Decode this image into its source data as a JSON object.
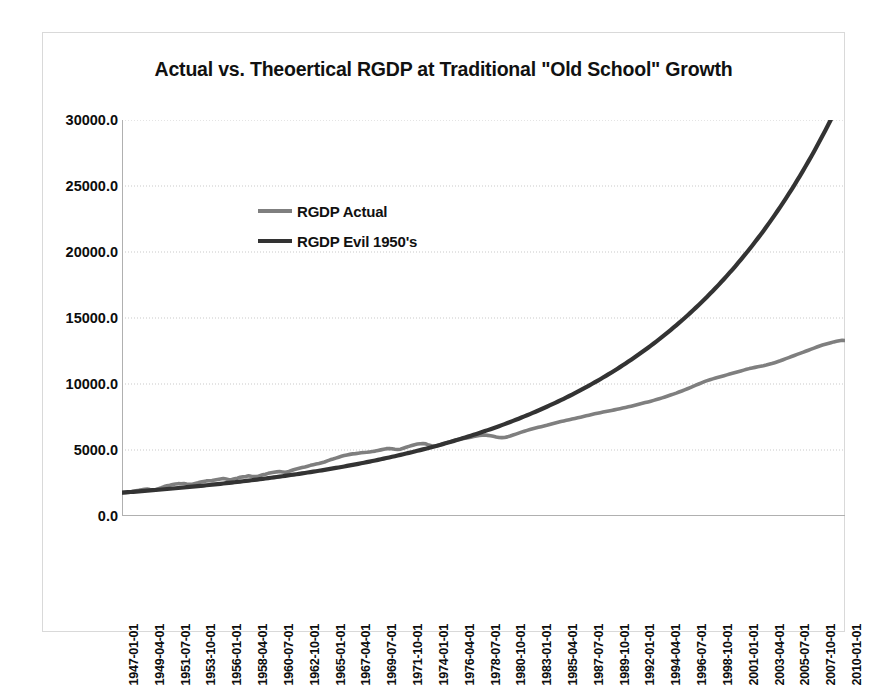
{
  "chart_data": {
    "type": "line",
    "title": "Actual vs. Theoertical  RGDP at Traditional \"Old School\" Growth",
    "xlabel": "",
    "ylabel": "",
    "ylim": [
      0,
      30000
    ],
    "yticks": [
      0,
      5000,
      10000,
      15000,
      20000,
      25000,
      30000
    ],
    "ytick_labels": [
      "0.0",
      "5000.0",
      "10000.0",
      "15000.0",
      "20000.0",
      "25000.0",
      "30000.0"
    ],
    "grid": true,
    "legend_position": "inside-upper-left",
    "x_tick_labels": [
      "1947-01-01",
      "1949-04-01",
      "1951-07-01",
      "1953-10-01",
      "1956-01-01",
      "1958-04-01",
      "1960-07-01",
      "1962-10-01",
      "1965-01-01",
      "1967-04-01",
      "1969-07-01",
      "1971-10-01",
      "1974-01-01",
      "1976-04-01",
      "1978-07-01",
      "1980-10-01",
      "1983-01-01",
      "1985-04-01",
      "1987-07-01",
      "1989-10-01",
      "1992-01-01",
      "1994-04-01",
      "1996-07-01",
      "1998-10-01",
      "2001-01-01",
      "2003-04-01",
      "2005-07-01",
      "2007-10-01",
      "2010-01-01"
    ],
    "x_start": "1947-01-01",
    "x_end": "2011-04-01",
    "x_frequency": "quarterly",
    "n_points": 258,
    "series": [
      {
        "name": "RGDP Actual",
        "color": "#7f7f7f",
        "values": [
          1770,
          1768,
          1780,
          1797,
          1871,
          1910,
          1944,
          1987,
          2021,
          2033,
          2008,
          1991,
          2006,
          2074,
          2145,
          2231,
          2292,
          2328,
          2382,
          2418,
          2450,
          2441,
          2458,
          2425,
          2404,
          2400,
          2463,
          2513,
          2576,
          2620,
          2659,
          2674,
          2689,
          2730,
          2770,
          2807,
          2840,
          2797,
          2744,
          2759,
          2815,
          2869,
          2936,
          2965,
          2997,
          3041,
          3016,
          2997,
          2985,
          3052,
          3120,
          3167,
          3231,
          3272,
          3311,
          3342,
          3369,
          3339,
          3310,
          3342,
          3428,
          3504,
          3563,
          3614,
          3668,
          3718,
          3775,
          3836,
          3889,
          3934,
          3982,
          4039,
          4093,
          4178,
          4256,
          4317,
          4385,
          4456,
          4520,
          4578,
          4624,
          4668,
          4705,
          4724,
          4756,
          4790,
          4813,
          4830,
          4854,
          4882,
          4916,
          4964,
          5010,
          5058,
          5102,
          5120,
          5100,
          5060,
          5035,
          5064,
          5138,
          5207,
          5274,
          5342,
          5405,
          5449,
          5478,
          5490,
          5465,
          5375,
          5317,
          5280,
          5322,
          5388,
          5450,
          5518,
          5580,
          5650,
          5710,
          5770,
          5820,
          5862,
          5894,
          5930,
          5972,
          6018,
          6062,
          6098,
          6120,
          6130,
          6110,
          6080,
          6035,
          5985,
          5948,
          5935,
          5950,
          5995,
          6060,
          6130,
          6205,
          6280,
          6352,
          6420,
          6487,
          6550,
          6610,
          6665,
          6718,
          6770,
          6820,
          6872,
          6930,
          6990,
          7050,
          7105,
          7158,
          7205,
          7250,
          7295,
          7340,
          7390,
          7440,
          7490,
          7540,
          7590,
          7640,
          7690,
          7738,
          7785,
          7830,
          7875,
          7920,
          7962,
          8000,
          8040,
          8085,
          8130,
          8175,
          8220,
          8268,
          8318,
          8370,
          8425,
          8480,
          8535,
          8590,
          8645,
          8700,
          8760,
          8820,
          8885,
          8950,
          9020,
          9090,
          9162,
          9235,
          9310,
          9390,
          9470,
          9555,
          9640,
          9730,
          9820,
          9910,
          10000,
          10090,
          10175,
          10255,
          10325,
          10390,
          10450,
          10510,
          10570,
          10630,
          10690,
          10750,
          10810,
          10870,
          10930,
          10990,
          11050,
          11110,
          11165,
          11215,
          11260,
          11300,
          11340,
          11385,
          11435,
          11490,
          11550,
          11615,
          11685,
          11760,
          11840,
          11920,
          12000,
          12080,
          12160,
          12240,
          12320,
          12400,
          12480,
          12560,
          12640,
          12720,
          12800,
          12880,
          12950,
          13010,
          13070,
          13130,
          13190,
          13240,
          13280,
          13310,
          13300,
          13240,
          13150,
          12950,
          12780,
          12720,
          12760,
          12840,
          12930,
          13010,
          13090,
          13150,
          13200,
          13230,
          13250,
          13260,
          13240,
          13250,
          13270,
          13280,
          13260
        ]
      },
      {
        "name": "RGDP Evil 1950's",
        "color": "#333333",
        "values": [
          1770,
          1786,
          1802,
          1818,
          1834,
          1851,
          1868,
          1885,
          1902,
          1919,
          1937,
          1954,
          1972,
          1990,
          2008,
          2027,
          2045,
          2064,
          2083,
          2102,
          2122,
          2141,
          2161,
          2181,
          2201,
          2222,
          2243,
          2264,
          2285,
          2306,
          2328,
          2350,
          2372,
          2394,
          2417,
          2440,
          2463,
          2486,
          2510,
          2534,
          2558,
          2582,
          2607,
          2632,
          2657,
          2683,
          2709,
          2735,
          2761,
          2788,
          2815,
          2842,
          2870,
          2898,
          2926,
          2955,
          2984,
          3013,
          3043,
          3073,
          3103,
          3134,
          3165,
          3196,
          3228,
          3260,
          3293,
          3326,
          3359,
          3393,
          3427,
          3461,
          3496,
          3532,
          3568,
          3604,
          3641,
          3678,
          3716,
          3754,
          3793,
          3832,
          3872,
          3912,
          3953,
          3994,
          4036,
          4078,
          4121,
          4164,
          4208,
          4253,
          4298,
          4343,
          4389,
          4436,
          4483,
          4531,
          4580,
          4629,
          4679,
          4729,
          4780,
          4832,
          4884,
          4937,
          4991,
          5045,
          5100,
          5156,
          5212,
          5269,
          5327,
          5386,
          5445,
          5505,
          5566,
          5628,
          5690,
          5753,
          5817,
          5882,
          5948,
          6014,
          6082,
          6150,
          6219,
          6289,
          6360,
          6432,
          6505,
          6579,
          6653,
          6729,
          6806,
          6884,
          6962,
          7042,
          7123,
          7205,
          7288,
          7372,
          7458,
          7544,
          7631,
          7720,
          7810,
          7901,
          7993,
          8086,
          8181,
          8277,
          8374,
          8472,
          8572,
          8673,
          8776,
          8879,
          8985,
          9091,
          9199,
          9309,
          9420,
          9532,
          9646,
          9762,
          9879,
          9998,
          10118,
          10240,
          10364,
          10489,
          10616,
          10745,
          10876,
          11008,
          11142,
          11278,
          11416,
          11556,
          11698,
          11842,
          11988,
          12136,
          12286,
          12438,
          12592,
          12749,
          12908,
          13069,
          13232,
          13398,
          13566,
          13736,
          13909,
          14085,
          14263,
          14443,
          14627,
          14813,
          15001,
          15193,
          15387,
          15584,
          15784,
          15987,
          16193,
          16402,
          16614,
          16830,
          17048,
          17270,
          17495,
          17724,
          17956,
          18191,
          18430,
          18673,
          18919,
          19169,
          19423,
          19681,
          19942,
          20208,
          20478,
          20752,
          21030,
          21313,
          21600,
          21892,
          22188,
          22489,
          22795,
          23105,
          23420,
          23741,
          24066,
          24397,
          24733,
          25074,
          25421,
          25773,
          26131,
          26495,
          26864,
          27240,
          27621,
          28009,
          28403,
          28803,
          29210,
          29623,
          30043,
          30470,
          30904,
          31345,
          31793,
          32248,
          32710,
          33180,
          33658,
          34143,
          34636,
          35137,
          35646,
          36164,
          36690,
          37224,
          37767,
          38319,
          38880,
          39450,
          40029,
          40617,
          41215,
          41823,
          42440,
          43067
        ]
      }
    ]
  },
  "legend": {
    "items": [
      {
        "label": "RGDP Actual",
        "color": "#7f7f7f"
      },
      {
        "label": "RGDP Evil 1950's",
        "color": "#333333"
      }
    ]
  }
}
